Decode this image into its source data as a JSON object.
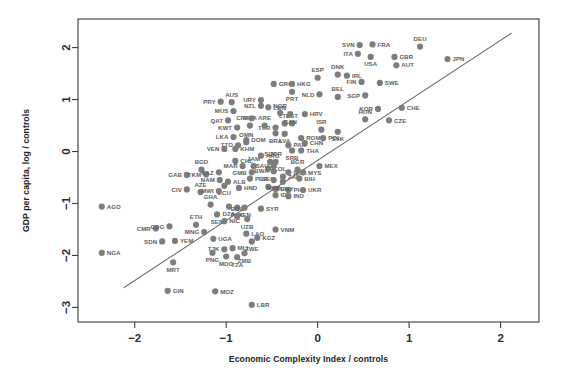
{
  "chart_data": {
    "type": "scatter",
    "title": "",
    "xlabel": "Economic Complexity Index / controls",
    "ylabel": "GDP per capita, log / controls",
    "xlim": [
      -2.62,
      2.42
    ],
    "ylim": [
      -3.28,
      2.55
    ],
    "xticks": [
      -2,
      -1,
      0,
      1,
      2
    ],
    "xticklabels": [
      "−2",
      "−1",
      "0",
      "1",
      "2"
    ],
    "yticks": [
      -3,
      -2,
      -1,
      0,
      1,
      2
    ],
    "yticklabels": [
      "−3",
      "−2",
      "−1",
      "0",
      "1",
      "2"
    ],
    "grid": false,
    "legend": null,
    "marker_color": "#7d7d7d",
    "label_color": "#5d5d5d",
    "fit_line": {
      "type": "linear",
      "x_start": -2.12,
      "y_start": -2.62,
      "x_end": 2.12,
      "y_end": 2.28,
      "color": "#6a6a6a"
    },
    "points": [
      {
        "code": "AGO",
        "x": -2.36,
        "y": -1.06,
        "lp": "right"
      },
      {
        "code": "NGA",
        "x": -2.36,
        "y": -1.95,
        "lp": "right"
      },
      {
        "code": "CMR",
        "x": -1.77,
        "y": -1.48,
        "lp": "left"
      },
      {
        "code": "COG",
        "x": -1.62,
        "y": -1.44,
        "lp": "left"
      },
      {
        "code": "SDN",
        "x": -1.7,
        "y": -1.73,
        "lp": "left"
      },
      {
        "code": "YEM",
        "x": -1.56,
        "y": -1.72,
        "lp": "right"
      },
      {
        "code": "MRT",
        "x": -1.58,
        "y": -2.13,
        "lp": "below"
      },
      {
        "code": "GIN",
        "x": -1.64,
        "y": -2.68,
        "lp": "right"
      },
      {
        "code": "ETH",
        "x": -1.33,
        "y": -1.41,
        "lp": "above"
      },
      {
        "code": "MNG",
        "x": -1.24,
        "y": -1.55,
        "lp": "left"
      },
      {
        "code": "UGA",
        "x": -1.14,
        "y": -1.68,
        "lp": "right"
      },
      {
        "code": "TJK",
        "x": -1.02,
        "y": -1.88,
        "lp": "left"
      },
      {
        "code": "PNG",
        "x": -1.15,
        "y": -1.95,
        "lp": "below"
      },
      {
        "code": "MDG",
        "x": -1.0,
        "y": -2.02,
        "lp": "below"
      },
      {
        "code": "MLI",
        "x": -0.93,
        "y": -1.86,
        "lp": "right"
      },
      {
        "code": "TZA",
        "x": -0.88,
        "y": -2.03,
        "lp": "below"
      },
      {
        "code": "ZMB",
        "x": -0.8,
        "y": -1.96,
        "lp": "below"
      },
      {
        "code": "MOZ",
        "x": -1.12,
        "y": -2.69,
        "lp": "right"
      },
      {
        "code": "LBR",
        "x": -0.72,
        "y": -2.95,
        "lp": "right"
      },
      {
        "code": "GAB",
        "x": -1.43,
        "y": -0.45,
        "lp": "left"
      },
      {
        "code": "BGD",
        "x": -1.27,
        "y": -0.35,
        "lp": "above"
      },
      {
        "code": "TKM",
        "x": -1.22,
        "y": -0.44,
        "lp": "left"
      },
      {
        "code": "CIV",
        "x": -1.43,
        "y": -0.73,
        "lp": "left"
      },
      {
        "code": "AZE",
        "x": -1.28,
        "y": -0.78,
        "lp": "above"
      },
      {
        "code": "GHA",
        "x": -1.17,
        "y": -1.02,
        "lp": "above"
      },
      {
        "code": "SEN",
        "x": -1.1,
        "y": -1.21,
        "lp": "below"
      },
      {
        "code": "NIC",
        "x": -1.02,
        "y": -1.34,
        "lp": "right"
      },
      {
        "code": "KAZ",
        "x": -1.08,
        "y": -0.4,
        "lp": "left"
      },
      {
        "code": "NAM",
        "x": -1.07,
        "y": -0.55,
        "lp": "left"
      },
      {
        "code": "ALB",
        "x": -0.98,
        "y": -0.58,
        "lp": "right"
      },
      {
        "code": "ECU",
        "x": -1.02,
        "y": -0.66,
        "lp": "below"
      },
      {
        "code": "MWI",
        "x": -1.08,
        "y": -0.76,
        "lp": "left"
      },
      {
        "code": "DZA",
        "x": -0.97,
        "y": -1.06,
        "lp": "below"
      },
      {
        "code": "PAK",
        "x": -0.88,
        "y": -1.08,
        "lp": "below"
      },
      {
        "code": "KEN",
        "x": -0.8,
        "y": -1.08,
        "lp": "below"
      },
      {
        "code": "BOL",
        "x": -0.88,
        "y": -1.25,
        "lp": "above"
      },
      {
        "code": "HND",
        "x": -0.86,
        "y": -0.7,
        "lp": "right"
      },
      {
        "code": "LAO",
        "x": -0.78,
        "y": -1.58,
        "lp": "right"
      },
      {
        "code": "KGZ",
        "x": -0.66,
        "y": -1.66,
        "lp": "right"
      },
      {
        "code": "ZWE",
        "x": -0.72,
        "y": -1.73,
        "lp": "below"
      },
      {
        "code": "UZB",
        "x": -0.77,
        "y": -1.3,
        "lp": "below"
      },
      {
        "code": "VNM",
        "x": -0.46,
        "y": -1.5,
        "lp": "right"
      },
      {
        "code": "VEN",
        "x": -1.02,
        "y": 0.05,
        "lp": "left"
      },
      {
        "code": "KHM",
        "x": -0.9,
        "y": 0.05,
        "lp": "right"
      },
      {
        "code": "MAR",
        "x": -0.82,
        "y": -0.28,
        "lp": "left"
      },
      {
        "code": "JAM",
        "x": -0.7,
        "y": -0.28,
        "lp": "above"
      },
      {
        "code": "GMB",
        "x": -0.72,
        "y": -0.4,
        "lp": "left"
      },
      {
        "code": "PER",
        "x": -0.74,
        "y": -0.52,
        "lp": "right"
      },
      {
        "code": "GEO",
        "x": -0.54,
        "y": -0.68,
        "lp": "above"
      },
      {
        "code": "SYR",
        "x": -0.62,
        "y": -1.1,
        "lp": "right"
      },
      {
        "code": "EGY",
        "x": -0.46,
        "y": -0.72,
        "lp": "right"
      },
      {
        "code": "IDN",
        "x": -0.46,
        "y": -0.84,
        "lp": "right"
      },
      {
        "code": "PHL",
        "x": -0.32,
        "y": -0.74,
        "lp": "right"
      },
      {
        "code": "IND",
        "x": -0.32,
        "y": -0.86,
        "lp": "right"
      },
      {
        "code": "COL",
        "x": -0.54,
        "y": -0.33,
        "lp": "right"
      },
      {
        "code": "MKD",
        "x": -0.48,
        "y": -0.55,
        "lp": "below"
      },
      {
        "code": "TUN",
        "x": -0.38,
        "y": -0.58,
        "lp": "below"
      },
      {
        "code": "ZAF",
        "x": -0.38,
        "y": -0.48,
        "lp": "right"
      },
      {
        "code": "BWA",
        "x": -0.48,
        "y": -0.38,
        "lp": "left"
      },
      {
        "code": "SAU",
        "x": -0.48,
        "y": -0.28,
        "lp": "left"
      },
      {
        "code": "SLV",
        "x": -0.52,
        "y": -0.2,
        "lp": "above"
      },
      {
        "code": "CHL",
        "x": -0.9,
        "y": -0.18,
        "lp": "right"
      },
      {
        "code": "TTO",
        "x": -0.87,
        "y": 0.12,
        "lp": "left"
      },
      {
        "code": "OMN",
        "x": -0.78,
        "y": 0.18,
        "lp": "above"
      },
      {
        "code": "LKA",
        "x": -0.92,
        "y": 0.28,
        "lp": "left"
      },
      {
        "code": "DOM",
        "x": -0.78,
        "y": 0.22,
        "lp": "right"
      },
      {
        "code": "ARG",
        "x": -0.62,
        "y": -0.08,
        "lp": "right"
      },
      {
        "code": "JOR",
        "x": -0.46,
        "y": -0.2,
        "lp": "above"
      },
      {
        "code": "RUS",
        "x": -0.32,
        "y": -0.4,
        "lp": "right"
      },
      {
        "code": "BGR",
        "x": -0.22,
        "y": -0.35,
        "lp": "above"
      },
      {
        "code": "MYS",
        "x": -0.16,
        "y": -0.4,
        "lp": "right"
      },
      {
        "code": "BIH",
        "x": -0.2,
        "y": -0.52,
        "lp": "right"
      },
      {
        "code": "UKR",
        "x": -0.16,
        "y": -0.74,
        "lp": "right"
      },
      {
        "code": "MEX",
        "x": 0.02,
        "y": -0.28,
        "lp": "right"
      },
      {
        "code": "BRA",
        "x": -0.46,
        "y": 0.35,
        "lp": "below"
      },
      {
        "code": "PAN",
        "x": -0.32,
        "y": 0.12,
        "lp": "right"
      },
      {
        "code": "SRB",
        "x": -0.28,
        "y": 0.02,
        "lp": "below"
      },
      {
        "code": "THA",
        "x": -0.18,
        "y": 0.02,
        "lp": "right"
      },
      {
        "code": "LVA",
        "x": -0.36,
        "y": 0.34,
        "lp": "below"
      },
      {
        "code": "ROM",
        "x": -0.18,
        "y": 0.26,
        "lp": "right"
      },
      {
        "code": "CHN",
        "x": -0.14,
        "y": 0.16,
        "lp": "right"
      },
      {
        "code": "POL",
        "x": 0.06,
        "y": 0.26,
        "lp": "right"
      },
      {
        "code": "ISR",
        "x": 0.04,
        "y": 0.42,
        "lp": "above"
      },
      {
        "code": "SVK",
        "x": 0.22,
        "y": 0.38,
        "lp": "below"
      },
      {
        "code": "TUR",
        "x": -0.46,
        "y": 0.46,
        "lp": "left"
      },
      {
        "code": "ARE",
        "x": -0.58,
        "y": 0.5,
        "lp": "above"
      },
      {
        "code": "LTU",
        "x": -0.36,
        "y": 0.54,
        "lp": "above"
      },
      {
        "code": "EST",
        "x": -0.28,
        "y": 0.54,
        "lp": "above"
      },
      {
        "code": "MDA",
        "x": -0.74,
        "y": 0.5,
        "lp": "above"
      },
      {
        "code": "KWT",
        "x": -0.88,
        "y": 0.46,
        "lp": "left"
      },
      {
        "code": "QAT",
        "x": -0.98,
        "y": 0.6,
        "lp": "left"
      },
      {
        "code": "MUS",
        "x": -0.92,
        "y": 0.78,
        "lp": "left"
      },
      {
        "code": "PRY",
        "x": -1.06,
        "y": 0.96,
        "lp": "left"
      },
      {
        "code": "AUS",
        "x": -0.94,
        "y": 0.95,
        "lp": "above"
      },
      {
        "code": "CRI",
        "x": -0.72,
        "y": 0.64,
        "lp": "left"
      },
      {
        "code": "NOR",
        "x": -0.41,
        "y": 0.74,
        "lp": "above"
      },
      {
        "code": "CAN",
        "x": -0.3,
        "y": 0.72,
        "lp": "below"
      },
      {
        "code": "HRV",
        "x": -0.14,
        "y": 0.72,
        "lp": "right"
      },
      {
        "code": "LBN",
        "x": -0.54,
        "y": 0.85,
        "lp": "right"
      },
      {
        "code": "NZL",
        "x": -0.62,
        "y": 0.88,
        "lp": "left"
      },
      {
        "code": "URY",
        "x": -0.62,
        "y": 0.99,
        "lp": "left"
      },
      {
        "code": "GRC",
        "x": -0.48,
        "y": 1.3,
        "lp": "right"
      },
      {
        "code": "PRT",
        "x": -0.28,
        "y": 1.15,
        "lp": "below"
      },
      {
        "code": "HKG",
        "x": -0.28,
        "y": 1.3,
        "lp": "right"
      },
      {
        "code": "ESP",
        "x": 0.0,
        "y": 1.42,
        "lp": "above"
      },
      {
        "code": "NLD",
        "x": 0.02,
        "y": 1.1,
        "lp": "left"
      },
      {
        "code": "BEL",
        "x": 0.22,
        "y": 1.05,
        "lp": "above"
      },
      {
        "code": "DNK",
        "x": 0.22,
        "y": 1.48,
        "lp": "above"
      },
      {
        "code": "IRL",
        "x": 0.32,
        "y": 1.46,
        "lp": "right"
      },
      {
        "code": "FIN",
        "x": 0.48,
        "y": 1.34,
        "lp": "left"
      },
      {
        "code": "SGP",
        "x": 0.52,
        "y": 1.08,
        "lp": "left"
      },
      {
        "code": "SWE",
        "x": 0.68,
        "y": 1.32,
        "lp": "right"
      },
      {
        "code": "SVN",
        "x": 0.46,
        "y": 2.05,
        "lp": "left"
      },
      {
        "code": "FRA",
        "x": 0.6,
        "y": 2.06,
        "lp": "right"
      },
      {
        "code": "ITA",
        "x": 0.44,
        "y": 1.88,
        "lp": "left"
      },
      {
        "code": "USA",
        "x": 0.58,
        "y": 1.82,
        "lp": "below"
      },
      {
        "code": "GBR",
        "x": 0.84,
        "y": 1.82,
        "lp": "right"
      },
      {
        "code": "AUT",
        "x": 0.86,
        "y": 1.66,
        "lp": "right"
      },
      {
        "code": "DEU",
        "x": 1.12,
        "y": 2.02,
        "lp": "above"
      },
      {
        "code": "JPN",
        "x": 1.42,
        "y": 1.78,
        "lp": "right"
      },
      {
        "code": "KOR",
        "x": 0.66,
        "y": 0.82,
        "lp": "left"
      },
      {
        "code": "CHE",
        "x": 0.92,
        "y": 0.84,
        "lp": "right"
      },
      {
        "code": "HUN",
        "x": 0.52,
        "y": 0.62,
        "lp": "above"
      },
      {
        "code": "CZE",
        "x": 0.78,
        "y": 0.6,
        "lp": "right"
      }
    ]
  }
}
